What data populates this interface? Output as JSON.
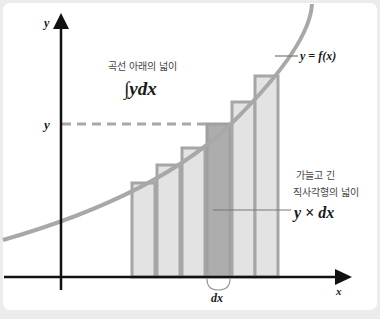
{
  "diagram": {
    "title_korean": "곡선 아래의 넓이",
    "integral_label": "∫ydx",
    "curve_label": "y = f(x)",
    "strip_label_line1": "가늘고 긴",
    "strip_label_line2": "직사각형의 넓이",
    "strip_formula": "y × dx",
    "axis_y_label": "y",
    "axis_x_label": "x",
    "y_level_label": "y",
    "dx_label": "dx",
    "colors": {
      "curve": "#a8a8a8",
      "bar_fill": "#e3e3e3",
      "bar_stroke": "#a6a6a6",
      "highlight_bar_fill": "#adadad",
      "axis": "#111111",
      "dashed_line": "#a8a8a8",
      "background": "#ececec",
      "card": "#ffffff"
    },
    "bars": [
      {
        "x": 132,
        "w": 23,
        "top": 183
      },
      {
        "x": 157,
        "w": 23,
        "top": 165
      },
      {
        "x": 182,
        "w": 23,
        "top": 148
      },
      {
        "x": 207,
        "w": 23,
        "top": 124,
        "highlight": true
      },
      {
        "x": 232,
        "w": 23,
        "top": 102
      },
      {
        "x": 255,
        "w": 23,
        "top": 76
      }
    ]
  }
}
